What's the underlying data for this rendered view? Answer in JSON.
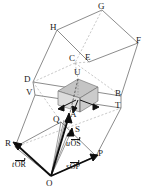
{
  "figure": {
    "kind": "geometry-diagram",
    "colors": {
      "line": "#4a4a4a",
      "dashed": "#9a9a9a",
      "shade_top": "#bfbfbf",
      "shade_left": "#d8d8d8",
      "shade_right": "#c9c9c9",
      "vector": "#111111",
      "label": "#1a1a1a",
      "background": "#ffffff"
    },
    "vertices": [
      {
        "id": "G",
        "label": "G",
        "x": 102,
        "y": 10,
        "lx": 98,
        "ly": 2
      },
      {
        "id": "H",
        "label": "H",
        "x": 57,
        "y": 30,
        "lx": 50,
        "ly": 23
      },
      {
        "id": "F",
        "label": "F",
        "x": 138,
        "y": 43,
        "lx": 136,
        "ly": 36
      },
      {
        "id": "E",
        "label": "E",
        "x": 89,
        "y": 62,
        "lx": 85,
        "ly": 53
      },
      {
        "id": "C",
        "label": "C",
        "x": 75,
        "y": 63,
        "lx": 69,
        "ly": 54
      },
      {
        "id": "D",
        "label": "D",
        "x": 33,
        "y": 82,
        "lx": 24,
        "ly": 75
      },
      {
        "id": "U",
        "label": "U",
        "x": 78,
        "y": 79,
        "lx": 74,
        "ly": 68
      },
      {
        "id": "V",
        "label": "V",
        "x": 35,
        "y": 95,
        "lx": 26,
        "ly": 88
      },
      {
        "id": "B",
        "label": "B",
        "x": 121,
        "y": 96,
        "lx": 115,
        "ly": 89
      },
      {
        "id": "T",
        "label": "T",
        "x": 121,
        "y": 108,
        "lx": 115,
        "ly": 101
      },
      {
        "id": "A",
        "label": "A",
        "x": 69,
        "y": 117,
        "lx": 70,
        "ly": 112
      },
      {
        "id": "Q",
        "label": "Q",
        "x": 61,
        "y": 122,
        "lx": 54,
        "ly": 115
      },
      {
        "id": "S",
        "label": "S",
        "x": 73,
        "y": 131,
        "lx": 75,
        "ly": 126
      },
      {
        "id": "R",
        "label": "R",
        "x": 15,
        "y": 147,
        "lx": 6,
        "ly": 140
      },
      {
        "id": "P",
        "label": "P",
        "x": 96,
        "y": 156,
        "lx": 98,
        "ly": 150
      },
      {
        "id": "O",
        "label": "O",
        "x": 51,
        "y": 176,
        "lx": 47,
        "ly": 179
      }
    ],
    "vector_labels": [
      {
        "id": "t-OR",
        "scalar": "t",
        "vector": "OR",
        "x": 12,
        "y": 160
      },
      {
        "id": "s-OP",
        "scalar": "s",
        "vector": "OP",
        "x": 66,
        "y": 162
      },
      {
        "id": "u-OS",
        "scalar": "u",
        "vector": "OS",
        "x": 66,
        "y": 139
      }
    ]
  }
}
